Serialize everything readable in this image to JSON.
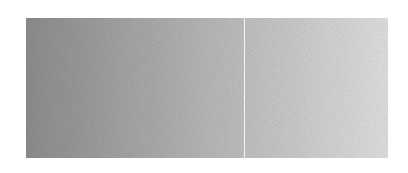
{
  "panel": {
    "gradient": {
      "direction": "to right",
      "start_color": "#8e8e8e",
      "mid_color": "#b9b9b9",
      "end_color": "#e2e2e2"
    },
    "noise": true,
    "divider": {
      "color": "#f4f4f4",
      "offset_px": 218
    }
  }
}
